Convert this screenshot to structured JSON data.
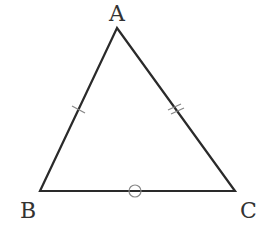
{
  "diagram": {
    "type": "triangle",
    "colors": {
      "stroke": "#2a2a2a",
      "marks": "#888888",
      "labels": "#333333",
      "background": "#ffffff"
    },
    "vertices": [
      {
        "name": "A",
        "x": 117,
        "y": 28
      },
      {
        "name": "B",
        "x": 40,
        "y": 191
      },
      {
        "name": "C",
        "x": 235,
        "y": 191
      }
    ],
    "labels": {
      "A": "A",
      "B": "B",
      "C": "C"
    },
    "marks": [
      {
        "side": "AB",
        "type": "single-tick"
      },
      {
        "side": "AC",
        "type": "double-tick"
      },
      {
        "side": "BC",
        "type": "circle"
      }
    ]
  }
}
